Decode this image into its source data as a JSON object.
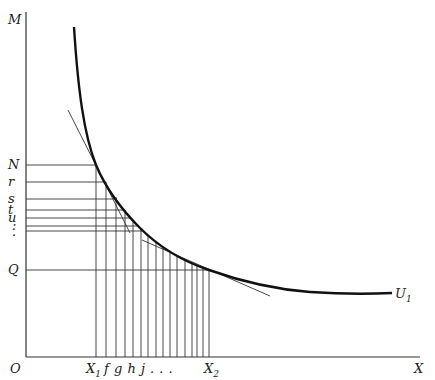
{
  "diagram": {
    "type": "indifference-curve",
    "axes": {
      "origin_label": "O",
      "y_label": "M",
      "x_label": "X"
    },
    "curve": {
      "label": "U",
      "label_sub": "1"
    },
    "y_ticks": [
      {
        "label": "N",
        "y": 165
      },
      {
        "label": "r",
        "y": 182
      },
      {
        "label": "s",
        "y": 199
      },
      {
        "label": "t",
        "y": 210
      },
      {
        "label": "u",
        "y": 218
      },
      {
        "label": ":",
        "y": 226
      },
      {
        "label": "",
        "y": 231
      },
      {
        "label": "Q",
        "y": 270
      }
    ],
    "x_ticks": {
      "start_label": "X",
      "start_sub": "1",
      "mid_labels": "f g h j . . .",
      "end_label": "X",
      "end_sub": "2"
    },
    "vertical_lines_x": [
      96,
      106,
      116,
      125,
      133,
      141,
      148,
      156,
      163,
      170,
      177,
      185,
      192,
      197,
      203,
      209
    ]
  }
}
